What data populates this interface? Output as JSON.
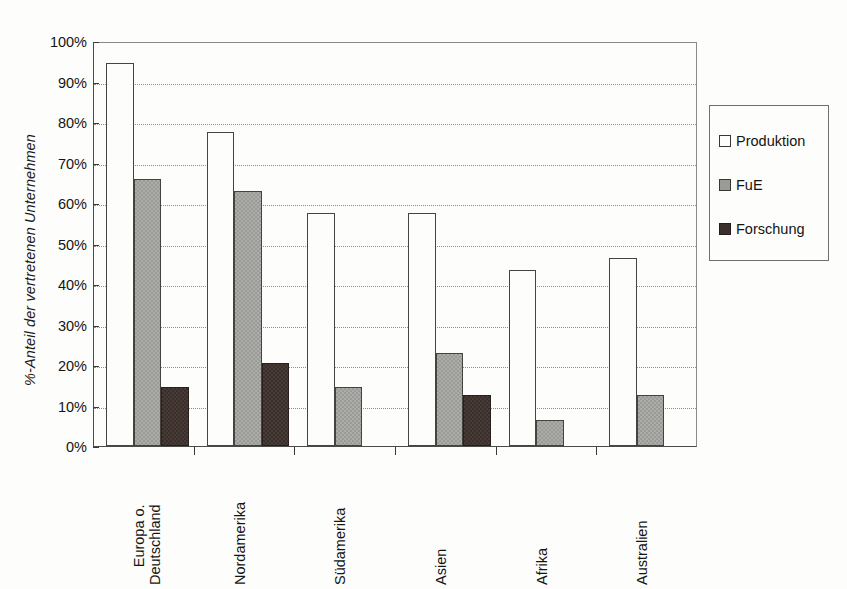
{
  "chart_data": {
    "type": "bar",
    "title": "",
    "xlabel": "",
    "ylabel": "%-Anteil der vertretenen Unternehmen",
    "ylim": [
      0,
      100
    ],
    "ytick_labels": [
      "100%",
      "90%",
      "80%",
      "70%",
      "60%",
      "50%",
      "40%",
      "30%",
      "20%",
      "10%",
      "0%"
    ],
    "ytick_values": [
      100,
      90,
      80,
      70,
      60,
      50,
      40,
      30,
      20,
      10,
      0
    ],
    "grid": "horizontal-dotted",
    "legend_position": "right",
    "categories": [
      "Europa o.\nDeutschland",
      "Nordamerika",
      "Südamerika",
      "Asien",
      "Afrika",
      "Australien"
    ],
    "series": [
      {
        "name": "Produktion",
        "color": "#fdfdfb",
        "values": [
          94.5,
          77.5,
          57.5,
          57.5,
          43.5,
          46.5
        ]
      },
      {
        "name": "FuE",
        "color": "#9a9a96",
        "values": [
          66.0,
          63.0,
          14.5,
          23.0,
          6.5,
          12.5
        ]
      },
      {
        "name": "Forschung",
        "color": "#3b2f2c",
        "values": [
          14.5,
          20.5,
          0,
          12.5,
          0,
          0
        ]
      }
    ]
  },
  "legend": {
    "items": [
      {
        "label": "Produktion",
        "swatch": "produktion"
      },
      {
        "label": "FuE",
        "swatch": "fue"
      },
      {
        "label": "Forschung",
        "swatch": "forschung"
      }
    ]
  }
}
